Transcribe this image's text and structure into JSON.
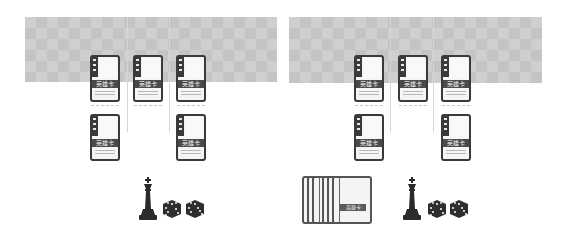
{
  "boards": [
    {
      "id": "left",
      "slots_top": [
        {
          "label": "英雄卡"
        },
        {
          "label": "英雄卡"
        },
        {
          "label": "英雄卡"
        }
      ],
      "slots_bottom": [
        {
          "label": "英雄卡"
        },
        null,
        {
          "label": "英雄卡"
        }
      ],
      "tokens": {
        "king": "king-piece",
        "dice": [
          "die-1",
          "die-2"
        ]
      }
    },
    {
      "id": "right",
      "slots_top": [
        {
          "label": "英雄卡"
        },
        {
          "label": "英雄卡"
        },
        {
          "label": "英雄卡"
        }
      ],
      "slots_bottom": [
        {
          "label": "英雄卡"
        },
        null,
        {
          "label": "英雄卡"
        }
      ],
      "deck": {
        "label": "英雄卡",
        "count_visible": 6
      },
      "tokens": {
        "king": "king-piece",
        "dice": [
          "die-1",
          "die-2"
        ]
      }
    }
  ],
  "colors": {
    "checker_light": "#cfcfcf",
    "checker_dark": "#c4c4c4",
    "card_border": "#3a3a3a",
    "piece": "#2b2b2b"
  }
}
